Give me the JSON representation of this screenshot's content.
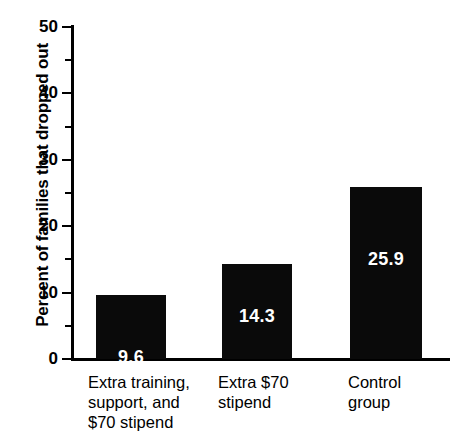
{
  "chart_data": {
    "type": "bar",
    "title": "",
    "xlabel": "",
    "ylabel": "Percent of families that dropped out",
    "categories": [
      "Extra training,\nsupport, and\n$70 stipend",
      "Extra $70\nstipend",
      "Control\ngroup"
    ],
    "values": [
      9.6,
      14.3,
      25.9
    ],
    "value_labels": [
      "9.6",
      "14.3",
      "25.9"
    ],
    "ylim": [
      0,
      50
    ],
    "y_ticks": [
      0,
      10,
      20,
      30,
      40,
      50
    ],
    "y_tick_labels": [
      "0",
      "10",
      "20",
      "30",
      "40",
      "50"
    ],
    "y_minor_ticks": [
      5,
      15,
      25,
      35,
      45
    ],
    "grid": false,
    "legend": false,
    "bar_color": "#0a0a0a",
    "value_label_color": "#ffffff",
    "axis_color": "#000000",
    "background_color": "#ffffff"
  },
  "axis": {
    "y_title": "Percent of families that dropped out"
  }
}
